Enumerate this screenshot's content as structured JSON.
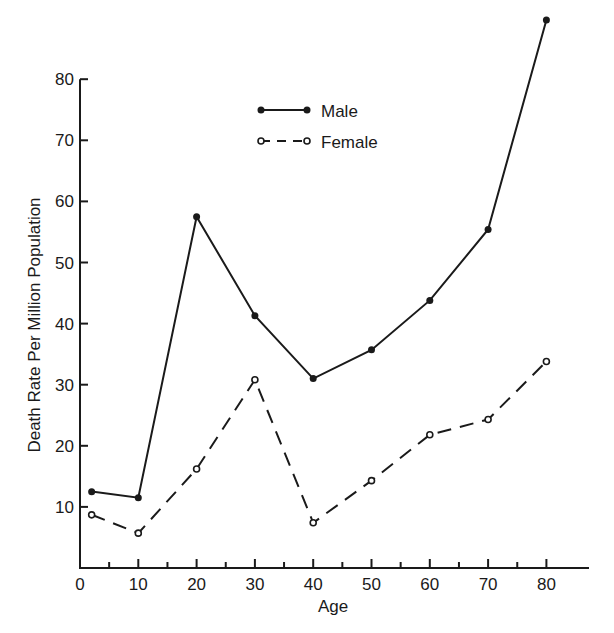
{
  "chart_data": {
    "type": "line",
    "title": "",
    "xlabel": "Age",
    "ylabel": "Death Rate Per Million Population",
    "xlim": [
      0,
      82
    ],
    "ylim": [
      0,
      80
    ],
    "x_ticks": [
      0,
      10,
      20,
      30,
      40,
      50,
      60,
      70,
      80
    ],
    "x_minor_ticks": [
      5,
      15,
      25,
      35,
      45,
      55,
      65,
      75
    ],
    "y_ticks": [
      10,
      20,
      30,
      40,
      50,
      60,
      70,
      80
    ],
    "grid": false,
    "legend_position": "upper-center",
    "x": [
      2,
      10,
      20,
      30,
      40,
      50,
      60,
      70,
      80
    ],
    "series": [
      {
        "name": "Male",
        "style": "solid",
        "marker": "filled-circle",
        "values": [
          12.5,
          11.5,
          57.5,
          41.3,
          31.0,
          35.7,
          43.8,
          55.4,
          89.7
        ]
      },
      {
        "name": "Female",
        "style": "dashed",
        "marker": "open-circle",
        "values": [
          8.7,
          5.7,
          16.2,
          30.8,
          7.4,
          14.3,
          21.8,
          24.3,
          33.8
        ]
      }
    ]
  },
  "colors": {
    "ink": "#1a1a1a",
    "background": "#ffffff"
  }
}
